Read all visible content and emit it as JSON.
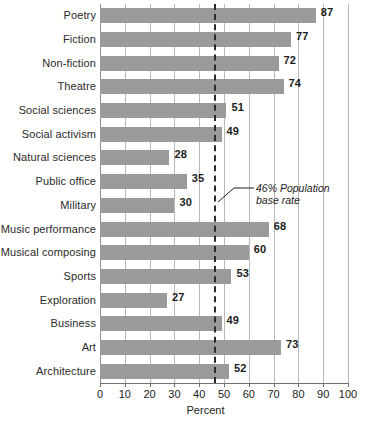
{
  "chart_data": {
    "type": "bar",
    "orientation": "horizontal",
    "title": "",
    "xlabel": "Percent",
    "ylabel": "",
    "xlim": [
      0,
      100
    ],
    "xticks": [
      0,
      10,
      20,
      30,
      40,
      50,
      60,
      70,
      80,
      90,
      100
    ],
    "grid": true,
    "legend": null,
    "bar_color": "#9a9a9a",
    "categories": [
      "Poetry",
      "Fiction",
      "Non-fiction",
      "Theatre",
      "Social sciences",
      "Social activism",
      "Natural sciences",
      "Public office",
      "Military",
      "Music performance",
      "Musical composing",
      "Sports",
      "Exploration",
      "Business",
      "Art",
      "Architecture"
    ],
    "values": [
      87,
      77,
      72,
      74,
      51,
      49,
      28,
      35,
      30,
      68,
      60,
      53,
      27,
      49,
      73,
      52
    ],
    "annotations": [
      {
        "name": "population-base-rate",
        "value": 46,
        "line1": "46% Population",
        "line2": "base rate",
        "style": "dashed-vertical-line"
      }
    ]
  }
}
